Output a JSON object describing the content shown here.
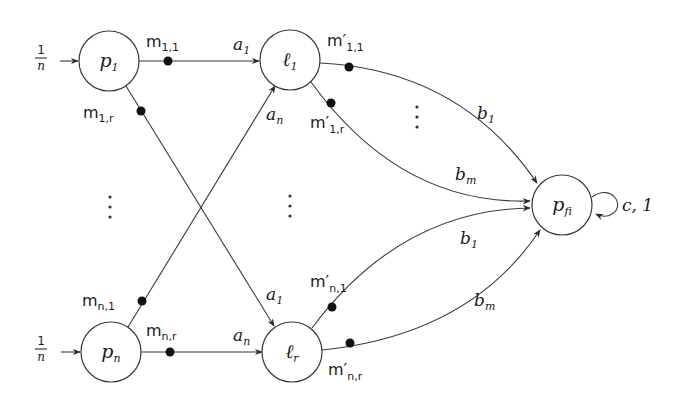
{
  "diagram": {
    "nodes": {
      "p1": {
        "main": "p",
        "sub": "1"
      },
      "pn": {
        "main": "p",
        "sub": "n"
      },
      "l1": {
        "main": "ℓ",
        "sub": "1"
      },
      "lr": {
        "main": "ℓ",
        "sub": "r"
      },
      "pfi": {
        "main": "p",
        "sub": "fi"
      }
    },
    "inputs": {
      "p1": {
        "num": "1",
        "den": "n"
      },
      "pn": {
        "num": "1",
        "den": "n"
      }
    },
    "messages": {
      "m11": {
        "main": "m",
        "sub": "1,1"
      },
      "m1r": {
        "main": "m",
        "sub": "1,r"
      },
      "mn1": {
        "main": "m",
        "sub": "n,1"
      },
      "mnr": {
        "main": "m",
        "sub": "n,r"
      },
      "mp11": {
        "main": "m′",
        "sub": "1,1"
      },
      "mp1r": {
        "main": "m′",
        "sub": "1,r"
      },
      "mpn1": {
        "main": "m′",
        "sub": "n,1"
      },
      "mpnr": {
        "main": "m′",
        "sub": "n,r"
      }
    },
    "edge_labels": {
      "p1_l1": {
        "main": "a",
        "sub": "1"
      },
      "pn_l1": {
        "main": "a",
        "sub": "n"
      },
      "p1_lr": {
        "main": "a",
        "sub": "1"
      },
      "pn_lr": {
        "main": "a",
        "sub": "n"
      },
      "l1_pfi_top": {
        "main": "b",
        "sub": "1"
      },
      "l1_pfi_bot": {
        "main": "b",
        "sub": "m"
      },
      "lr_pfi_top": {
        "main": "b",
        "sub": "1"
      },
      "lr_pfi_bot": {
        "main": "b",
        "sub": "m"
      },
      "self_loop": "c, 1"
    },
    "ellipses": {
      "left": "⋮",
      "middle": "⋮",
      "right_top": "⋮"
    }
  }
}
